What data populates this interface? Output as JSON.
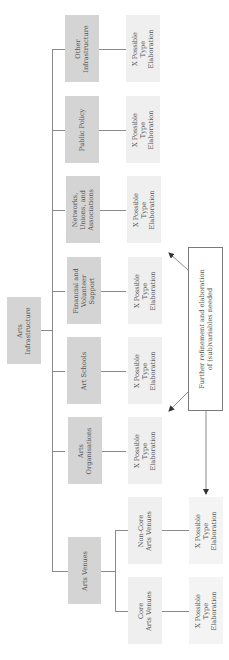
{
  "root": {
    "lines": [
      "Arts",
      "Infrastructure"
    ]
  },
  "categories": [
    {
      "id": "other",
      "lines": [
        "Other",
        "Infrastructure"
      ],
      "elaboration": [
        "X Possible",
        "Type",
        "Elaboration"
      ]
    },
    {
      "id": "public-policy",
      "lines": [
        "Public Policy"
      ],
      "elaboration": [
        "X Possible",
        "Type",
        "Elaboration"
      ]
    },
    {
      "id": "networks",
      "lines": [
        "Networks,",
        "Unions, and",
        "Associations"
      ],
      "elaboration": [
        "X Possible",
        "Type",
        "Elaboration"
      ]
    },
    {
      "id": "financial",
      "lines": [
        "Financial and",
        "Volunteer",
        "Support"
      ],
      "elaboration": [
        "X Possible",
        "Type",
        "Elaboration"
      ]
    },
    {
      "id": "art-schools",
      "lines": [
        "Art Schools"
      ],
      "elaboration": [
        "X Possible",
        "Type",
        "Elaboration"
      ]
    },
    {
      "id": "arts-organisations",
      "lines": [
        "Arts",
        "Organisations"
      ],
      "elaboration": [
        "X Possible",
        "Type",
        "Elaboration"
      ]
    },
    {
      "id": "arts-venues",
      "lines": [
        "Arts Venues"
      ]
    }
  ],
  "venues": [
    {
      "id": "non-core",
      "lines": [
        "Non-Core",
        "Arts Venues"
      ],
      "elaboration": [
        "X Possible",
        "Type",
        "Elaboration"
      ]
    },
    {
      "id": "core",
      "lines": [
        "Core",
        "Arts Venues"
      ],
      "elaboration": [
        "X Possible",
        "Type",
        "Elaboration"
      ]
    }
  ],
  "callout": {
    "lines": [
      "Further refinement and elaboration",
      "of (sub)variables needed"
    ]
  },
  "colors": {
    "category_box": "#d4d4d4",
    "elaboration_box": "#efefef",
    "line": "#8a8a8a",
    "text": "#555555"
  }
}
